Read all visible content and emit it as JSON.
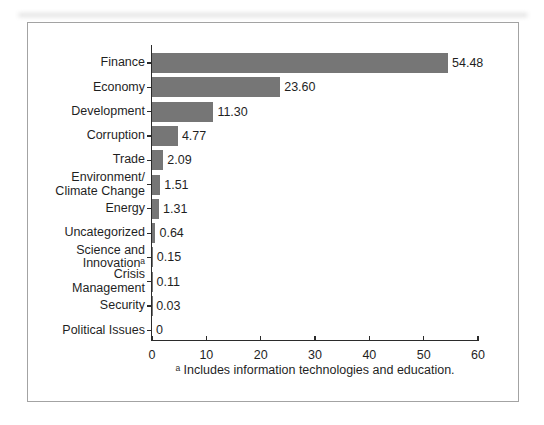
{
  "chart_data": {
    "type": "bar",
    "orientation": "horizontal",
    "title": "",
    "xlabel": "",
    "ylabel": "",
    "xlim": [
      0,
      60
    ],
    "xticks": [
      "0",
      "10",
      "20",
      "30",
      "40",
      "50",
      "60"
    ],
    "xtick_values": [
      0,
      10,
      20,
      30,
      40,
      50,
      60
    ],
    "grid": false,
    "legend": "none",
    "bar_color": "#767676",
    "categories": [
      "Finance",
      "Economy",
      "Development",
      "Corruption",
      "Trade",
      "Environment/ Climate Change",
      "Energy",
      "Uncategorized",
      "Science and Innovationᵃ",
      "Crisis Management",
      "Security",
      "Political Issues"
    ],
    "category_lines": [
      [
        "Finance"
      ],
      [
        "Economy"
      ],
      [
        "Development"
      ],
      [
        "Corruption"
      ],
      [
        "Trade"
      ],
      [
        "Environment/",
        "Climate Change"
      ],
      [
        "Energy"
      ],
      [
        "Uncategorized"
      ],
      [
        "Science and",
        "Innovationᵃ"
      ],
      [
        "Crisis",
        "Management"
      ],
      [
        "Security"
      ],
      [
        "Political Issues"
      ]
    ],
    "values": [
      54.48,
      23.6,
      11.3,
      4.77,
      2.09,
      1.51,
      1.31,
      0.64,
      0.15,
      0.11,
      0.03,
      0
    ],
    "value_labels": [
      "54.48",
      "23.60",
      "11.30",
      "4.77",
      "2.09",
      "1.51",
      "1.31",
      "0.64",
      "0.15",
      "0.11",
      "0.03",
      "0"
    ],
    "footnote": "ᵃ Includes information technologies and education."
  }
}
